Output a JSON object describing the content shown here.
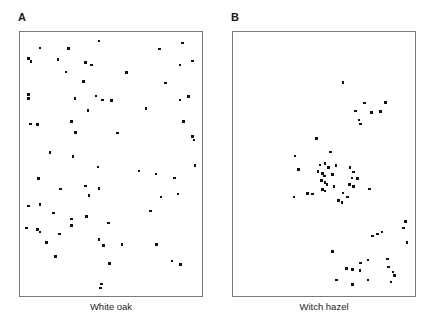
{
  "figure": {
    "type": "two-panel-scatter-figure",
    "background_color": "#ffffff",
    "border_color": "#7a7a7a",
    "dot_color": "#111111"
  },
  "panels": [
    {
      "letter": "A",
      "axis_label": "White oak",
      "letter_position": {
        "x": 18,
        "y": 12
      },
      "box": {
        "x": 19,
        "y": 31,
        "width": 184,
        "height": 266
      },
      "label_position": {
        "x": 19,
        "y": 302,
        "width": 184
      },
      "pattern": "random"
    },
    {
      "letter": "B",
      "axis_label": "Witch hazel",
      "letter_position": {
        "x": 231,
        "y": 12
      },
      "box": {
        "x": 232,
        "y": 31,
        "width": 184,
        "height": 266
      },
      "label_position": {
        "x": 232,
        "y": 302,
        "width": 184
      },
      "pattern": "clumped"
    }
  ],
  "chart_data": {
    "type": "scatter",
    "title": "",
    "xlabel": "",
    "ylabel": "",
    "grid": false,
    "legend": false,
    "axis_ticks": false,
    "xlim": [
      0,
      1
    ],
    "ylim": [
      0,
      1
    ],
    "series": [
      {
        "name": "White oak",
        "panel": "A",
        "marker": "square",
        "marker_color": "#111111",
        "count": 70,
        "points": [
          [
            0.43,
            0.026
          ],
          [
            0.9,
            0.033
          ],
          [
            0.1,
            0.052
          ],
          [
            0.26,
            0.055
          ],
          [
            0.77,
            0.056
          ],
          [
            0.035,
            0.093
          ],
          [
            0.2,
            0.098
          ],
          [
            0.05,
            0.105
          ],
          [
            0.355,
            0.108
          ],
          [
            0.39,
            0.118
          ],
          [
            0.885,
            0.118
          ],
          [
            0.955,
            0.102
          ],
          [
            0.245,
            0.145
          ],
          [
            0.585,
            0.147
          ],
          [
            0.345,
            0.182
          ],
          [
            0.805,
            0.188
          ],
          [
            0.035,
            0.232
          ],
          [
            0.035,
            0.247
          ],
          [
            0.295,
            0.247
          ],
          [
            0.45,
            0.252
          ],
          [
            0.5,
            0.255
          ],
          [
            0.415,
            0.238
          ],
          [
            0.935,
            0.24
          ],
          [
            0.885,
            0.252
          ],
          [
            0.37,
            0.293
          ],
          [
            0.695,
            0.285
          ],
          [
            0.045,
            0.345
          ],
          [
            0.085,
            0.347
          ],
          [
            0.275,
            0.335
          ],
          [
            0.905,
            0.335
          ],
          [
            0.3,
            0.378
          ],
          [
            0.535,
            0.38
          ],
          [
            0.955,
            0.392
          ],
          [
            0.965,
            0.406
          ],
          [
            0.155,
            0.455
          ],
          [
            0.285,
            0.47
          ],
          [
            0.425,
            0.51
          ],
          [
            0.97,
            0.505
          ],
          [
            0.655,
            0.525
          ],
          [
            0.75,
            0.537
          ],
          [
            0.09,
            0.555
          ],
          [
            0.855,
            0.552
          ],
          [
            0.215,
            0.595
          ],
          [
            0.355,
            0.583
          ],
          [
            0.43,
            0.592
          ],
          [
            0.375,
            0.62
          ],
          [
            0.78,
            0.625
          ],
          [
            0.875,
            0.615
          ],
          [
            0.035,
            0.66
          ],
          [
            0.1,
            0.655
          ],
          [
            0.175,
            0.688
          ],
          [
            0.72,
            0.68
          ],
          [
            0.36,
            0.7
          ],
          [
            0.275,
            0.71
          ],
          [
            0.025,
            0.745
          ],
          [
            0.085,
            0.75
          ],
          [
            0.1,
            0.76
          ],
          [
            0.275,
            0.735
          ],
          [
            0.485,
            0.725
          ],
          [
            0.21,
            0.768
          ],
          [
            0.135,
            0.8
          ],
          [
            0.43,
            0.79
          ],
          [
            0.455,
            0.812
          ],
          [
            0.56,
            0.808
          ],
          [
            0.755,
            0.808
          ],
          [
            0.185,
            0.855
          ],
          [
            0.49,
            0.882
          ],
          [
            0.84,
            0.872
          ],
          [
            0.89,
            0.885
          ],
          [
            0.445,
            0.96
          ],
          [
            0.44,
            0.975
          ]
        ]
      },
      {
        "name": "Witch hazel",
        "panel": "B",
        "marker": "square",
        "marker_color": "#111111",
        "count": 60,
        "points": [
          [
            0.605,
            0.185
          ],
          [
            0.725,
            0.265
          ],
          [
            0.845,
            0.262
          ],
          [
            0.675,
            0.295
          ],
          [
            0.765,
            0.3
          ],
          [
            0.815,
            0.298
          ],
          [
            0.695,
            0.33
          ],
          [
            0.705,
            0.345
          ],
          [
            0.455,
            0.4
          ],
          [
            0.335,
            0.468
          ],
          [
            0.535,
            0.452
          ],
          [
            0.475,
            0.503
          ],
          [
            0.505,
            0.497
          ],
          [
            0.525,
            0.512
          ],
          [
            0.565,
            0.505
          ],
          [
            0.355,
            0.52
          ],
          [
            0.465,
            0.527
          ],
          [
            0.49,
            0.535
          ],
          [
            0.5,
            0.545
          ],
          [
            0.545,
            0.54
          ],
          [
            0.645,
            0.512
          ],
          [
            0.665,
            0.53
          ],
          [
            0.655,
            0.552
          ],
          [
            0.685,
            0.555
          ],
          [
            0.485,
            0.562
          ],
          [
            0.505,
            0.57
          ],
          [
            0.515,
            0.578
          ],
          [
            0.64,
            0.578
          ],
          [
            0.665,
            0.585
          ],
          [
            0.555,
            0.585
          ],
          [
            0.49,
            0.598
          ],
          [
            0.505,
            0.602
          ],
          [
            0.405,
            0.612
          ],
          [
            0.435,
            0.615
          ],
          [
            0.605,
            0.61
          ],
          [
            0.63,
            0.625
          ],
          [
            0.755,
            0.595
          ],
          [
            0.58,
            0.64
          ],
          [
            0.6,
            0.648
          ],
          [
            0.33,
            0.625
          ],
          [
            0.955,
            0.72
          ],
          [
            0.945,
            0.745
          ],
          [
            0.77,
            0.775
          ],
          [
            0.8,
            0.768
          ],
          [
            0.825,
            0.76
          ],
          [
            0.965,
            0.8
          ],
          [
            0.545,
            0.835
          ],
          [
            0.705,
            0.88
          ],
          [
            0.745,
            0.868
          ],
          [
            0.855,
            0.865
          ],
          [
            0.625,
            0.9
          ],
          [
            0.66,
            0.905
          ],
          [
            0.7,
            0.908
          ],
          [
            0.86,
            0.895
          ],
          [
            0.885,
            0.915
          ],
          [
            0.895,
            0.928
          ],
          [
            0.57,
            0.945
          ],
          [
            0.745,
            0.945
          ],
          [
            0.66,
            0.962
          ],
          [
            0.875,
            0.952
          ]
        ]
      }
    ]
  }
}
